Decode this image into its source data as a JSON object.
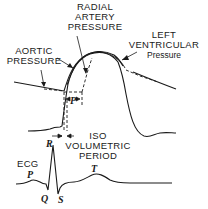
{
  "labels": {
    "radial_artery": [
      "RADIAL",
      "ARTERY",
      "PRESSURE"
    ],
    "aortic": [
      "AORTIC",
      "PRESSURE"
    ],
    "left_ventricular": [
      "LEFT",
      "VENTRICULAR",
      "Pressure"
    ],
    "iso_volumetric": [
      "ISO",
      "VOLUMETRIC",
      "PERIOD"
    ],
    "ecg": "ECG",
    "p_interval": "P",
    "ecg_waves": {
      "p": "P",
      "q": "Q",
      "r": "R",
      "s": "S",
      "t": "T"
    }
  },
  "colors": {
    "ink": "#1a1a1a",
    "background": "#ffffff"
  }
}
